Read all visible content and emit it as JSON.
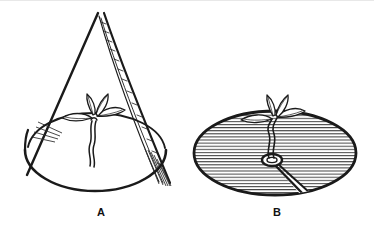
{
  "figure": {
    "background_color": "#ffffff",
    "ink_color": "#1a1a1a",
    "hatch_color": "#333333",
    "panels": [
      {
        "id": "panel-a",
        "label": "A",
        "label_x": 101,
        "label_y": 216,
        "caption": "Cone-shaped seedling cover set over a soil mound with a seedling emerging at the center",
        "parts": {
          "cone": "conical cover drawn in outline with apex at top",
          "seam": "vertical overlapping seam strip with short hatch ticks running from apex to base on the right side",
          "mound": "oval soil mound, unshaded",
          "seedling": "small seedling with four leaves and a wavy double-line stem",
          "ground_strokes": "short radiating strokes at the left where cone meets the mound"
        }
      },
      {
        "id": "panel-b",
        "label": "B",
        "label_x": 277,
        "label_y": 216,
        "caption": "Top view of the circular hatched disc with a radial slit and a center hole around the seedling stem",
        "parts": {
          "disc": "large oval disc filled with horizontal hatch lines",
          "slit": "tapered radial slit widening from the center hole toward the lower right rim",
          "center_hole": "small ring-shaped hole at the disc center",
          "seedling": "seedling with four leaves rising from the center hole on a wavy double-line stem"
        }
      }
    ]
  }
}
